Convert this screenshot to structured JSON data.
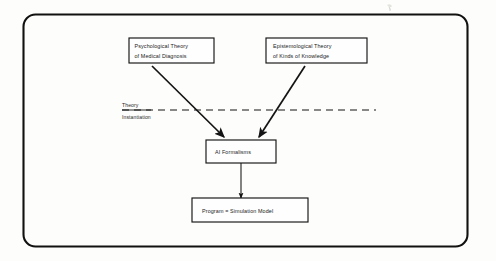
{
  "figure": {
    "background_color": "#fdfdfb",
    "ink_color": "#141414",
    "frame": {
      "name": "rounded-outer-frame",
      "corner_radius": 12
    }
  },
  "nodes": [
    {
      "id": "psychological-theory",
      "lines": [
        "Psychological Theory",
        "of Medical Diagnosis"
      ]
    },
    {
      "id": "epistemological-theory",
      "lines": [
        "Epistemological Theory",
        "of Kinds of Knowledge"
      ]
    },
    {
      "id": "ai-formalisms",
      "lines": [
        "AI Formalisms"
      ]
    },
    {
      "id": "program-simulation-model",
      "lines": [
        "Program  =  Simulation Model"
      ]
    }
  ],
  "divider": {
    "above_label": "Theory",
    "below_label": "Instantiation",
    "style": "dashed"
  },
  "edges": [
    {
      "id": "psych-to-ai",
      "from": "psychological-theory",
      "to": "ai-formalisms",
      "style": "solid-arrow"
    },
    {
      "id": "epist-to-ai",
      "from": "epistemological-theory",
      "to": "ai-formalisms",
      "style": "solid-arrow"
    },
    {
      "id": "ai-to-program",
      "from": "ai-formalisms",
      "to": "program-simulation-model",
      "style": "solid-arrow"
    }
  ]
}
